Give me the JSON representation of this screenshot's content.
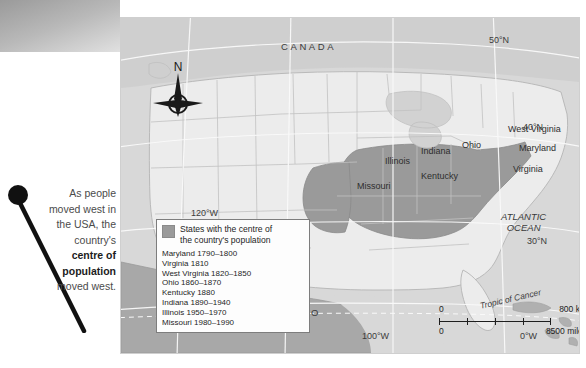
{
  "caption": {
    "line1": "As people",
    "line2": "moved west in",
    "line3": "the USA, the",
    "line4": "country's",
    "bold1": "centre of",
    "bold2": "population",
    "line5": "moved west."
  },
  "map": {
    "countries": [
      {
        "name": "canada",
        "label": "CANADA"
      },
      {
        "name": "mexico",
        "label": "MEXICO"
      }
    ],
    "ocean": {
      "line1": "ATLANTIC",
      "line2": "OCEAN"
    },
    "tropic": "Tropic of Cancer",
    "compass": {
      "north_label": "N",
      "icon": "compass-rose-icon"
    },
    "coordinates": [
      {
        "name": "lat-50n",
        "label": "50°N"
      },
      {
        "name": "lat-40n",
        "label": "40°N"
      },
      {
        "name": "lat-30n",
        "label": "30°N"
      },
      {
        "name": "lon-120w",
        "label": "120°W"
      },
      {
        "name": "lon-100w",
        "label": "100°W"
      },
      {
        "name": "lon-0w",
        "label": "0°W"
      }
    ],
    "states": [
      {
        "name": "illinois",
        "label": "Illinois"
      },
      {
        "name": "indiana",
        "label": "Indiana"
      },
      {
        "name": "ohio",
        "label": "Ohio"
      },
      {
        "name": "west-virginia",
        "label": "West Virginia"
      },
      {
        "name": "maryland",
        "label": "Maryland"
      },
      {
        "name": "virginia",
        "label": "Virginia"
      },
      {
        "name": "kentucky",
        "label": "Kentucky"
      },
      {
        "name": "missouri",
        "label": "Missouri"
      }
    ],
    "colors": {
      "ocean": "#d8d8d8",
      "land": "#ececec",
      "highlight": "#9a9a9a",
      "border": "#b4b4b4"
    }
  },
  "legend": {
    "title_line1": "States with the centre of",
    "title_line2": "the country's population",
    "entries": [
      "Maryland 1790–1800",
      "Virginia 1810",
      "West Virginia 1820–1850",
      "Ohio 1860–1870",
      "Kentucky 1880",
      "Indiana 1890–1940",
      "Illinois 1950–1970",
      "Missouri 1980–1990"
    ]
  },
  "scalebar": {
    "km": {
      "start": "0",
      "end": "800 km"
    },
    "miles": {
      "start": "0",
      "end": "8500 miles"
    }
  }
}
